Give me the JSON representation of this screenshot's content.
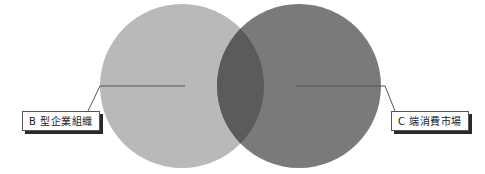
{
  "diagram": {
    "type": "venn",
    "circles": [
      {
        "id": "left",
        "label": "B 型企業組織",
        "color": "#b9b9b9"
      },
      {
        "id": "right",
        "label": "C 端消費市場",
        "color": "#7a7a7a"
      }
    ],
    "intersection_color": "#5b5b5b"
  },
  "labels": {
    "left": "B 型企業組織",
    "right": "C 端消費市場"
  }
}
